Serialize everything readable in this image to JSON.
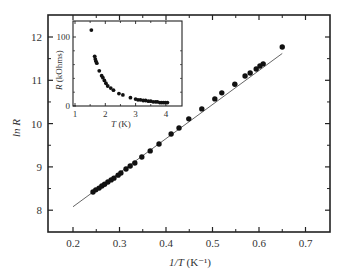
{
  "chart_data": [
    {
      "type": "scatter",
      "title": "",
      "xlabel": "1/T (K⁻¹)",
      "ylabel": "ln R",
      "xlim": [
        0.15,
        0.75
      ],
      "ylim": [
        7.5,
        12.5
      ],
      "xticks": [
        0.2,
        0.3,
        0.4,
        0.5,
        0.6,
        0.7
      ],
      "xtick_labels": [
        "0.2",
        "0.3",
        "0.4",
        "0.5",
        "0.6",
        "0.7"
      ],
      "yticks": [
        8,
        9,
        10,
        11,
        12
      ],
      "ytick_labels": [
        "8",
        "9",
        "10",
        "11",
        "12"
      ],
      "grid": false,
      "legend": null,
      "series": [
        {
          "name": "data",
          "marker": "filled-circle",
          "x": [
            0.243,
            0.249,
            0.256,
            0.262,
            0.268,
            0.275,
            0.282,
            0.288,
            0.297,
            0.303,
            0.314,
            0.323,
            0.333,
            0.348,
            0.366,
            0.385,
            0.411,
            0.428,
            0.449,
            0.477,
            0.505,
            0.52,
            0.548,
            0.57,
            0.581,
            0.594,
            0.602,
            0.609,
            0.65
          ],
          "y": [
            8.42,
            8.47,
            8.51,
            8.56,
            8.6,
            8.65,
            8.7,
            8.74,
            8.81,
            8.86,
            8.95,
            9.02,
            9.09,
            9.23,
            9.37,
            9.53,
            9.76,
            9.9,
            10.11,
            10.34,
            10.57,
            10.71,
            10.91,
            11.1,
            11.17,
            11.26,
            11.33,
            11.38,
            11.77
          ]
        },
        {
          "name": "linear fit",
          "style": "thin-line",
          "x": [
            0.2,
            0.65
          ],
          "y": [
            8.08,
            11.62
          ]
        }
      ]
    },
    {
      "type": "scatter",
      "title": "inset",
      "xlabel": "T (K)",
      "ylabel": "R (kOhms)",
      "xlim": [
        0.9,
        4.5
      ],
      "ylim": [
        0,
        115
      ],
      "xticks": [
        1,
        2,
        3,
        4
      ],
      "xtick_labels": [
        "1",
        "2",
        "3",
        "4"
      ],
      "yticks": [
        0,
        100
      ],
      "ytick_labels": [
        "0",
        "100"
      ],
      "grid": false,
      "series": [
        {
          "name": "data",
          "marker": "filled-circle",
          "x": [
            1.54,
            1.65,
            1.67,
            1.69,
            1.72,
            1.8,
            1.88,
            1.92,
            1.97,
            2.02,
            2.08,
            2.18,
            2.27,
            2.45,
            2.58,
            2.83,
            3.0,
            3.08,
            3.16,
            3.25,
            3.33,
            3.42,
            3.5,
            3.58,
            3.66,
            3.72,
            3.8,
            3.86,
            3.92,
            3.98,
            4.05
          ],
          "y": [
            110,
            72,
            68,
            65,
            62,
            51,
            44,
            41,
            37,
            33,
            29,
            26,
            23,
            18,
            16,
            12,
            10,
            9,
            9,
            8,
            8,
            7,
            7,
            6,
            6,
            6,
            5,
            5,
            5,
            5,
            5
          ]
        }
      ]
    }
  ],
  "labels": {
    "main_ylabel": "ln R",
    "main_xlabel_main": "1/T",
    "main_xlabel_unit": " (K⁻¹)",
    "inset_ylabel_main": "R",
    "inset_ylabel_unit": " (kOhms)",
    "inset_xlabel_main": "T",
    "inset_xlabel_unit": " (K)"
  },
  "colors": {
    "axis": "#222222",
    "marker": "#111111",
    "fit_line": "#555555"
  }
}
